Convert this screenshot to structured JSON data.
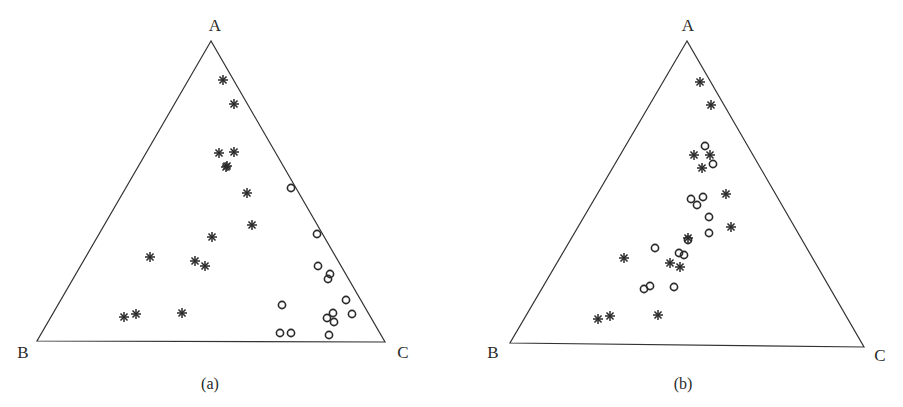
{
  "chart_data": [
    {
      "type": "scatter",
      "subtype": "ternary",
      "caption": "(a)",
      "vertex_labels": {
        "top": "A",
        "left": "B",
        "right": "C"
      },
      "frame": {
        "apex": [
          211,
          41
        ],
        "left": [
          37,
          341
        ],
        "right": [
          385,
          342
        ]
      },
      "label_pos": {
        "A": [
          215,
          25
        ],
        "B": [
          23,
          352
        ],
        "C": [
          403,
          352
        ],
        "caption": [
          210,
          383
        ]
      },
      "series": [
        {
          "name": "asterisk",
          "marker": "asterisk",
          "pixels": [
            [
              223,
              80
            ],
            [
              234,
              104
            ],
            [
              219,
              153
            ],
            [
              234,
              152
            ],
            [
              227,
              166
            ],
            [
              226,
              167
            ],
            [
              247,
              193
            ],
            [
              252,
              225
            ],
            [
              212,
              237
            ],
            [
              150,
              257
            ],
            [
              195,
              261
            ],
            [
              205,
              266
            ],
            [
              124,
              317
            ],
            [
              136,
              314
            ],
            [
              182,
              313
            ]
          ],
          "ternary_ABC": [
            [
              0.87,
              0.09,
              0.04
            ],
            [
              0.79,
              0.14,
              0.07
            ],
            [
              0.63,
              0.29,
              0.08
            ],
            [
              0.63,
              0.25,
              0.12
            ],
            [
              0.59,
              0.3,
              0.11
            ],
            [
              0.58,
              0.31,
              0.11
            ],
            [
              0.5,
              0.32,
              0.18
            ],
            [
              0.39,
              0.39,
              0.22
            ],
            [
              0.35,
              0.49,
              0.16
            ],
            [
              0.28,
              0.7,
              0.02
            ],
            [
              0.27,
              0.58,
              0.15
            ],
            [
              0.25,
              0.55,
              0.2
            ],
            [
              0.08,
              0.84,
              0.08
            ],
            [
              0.09,
              0.8,
              0.11
            ],
            [
              0.1,
              0.66,
              0.24
            ]
          ]
        },
        {
          "name": "circle",
          "marker": "circle",
          "pixels": [
            [
              291,
              188
            ],
            [
              317,
              234
            ],
            [
              318,
              266
            ],
            [
              330,
              274
            ],
            [
              328,
              279
            ],
            [
              346,
              300
            ],
            [
              282,
              305
            ],
            [
              333,
              313
            ],
            [
              352,
              314
            ],
            [
              327,
              318
            ],
            [
              334,
              322
            ],
            [
              280,
              333
            ],
            [
              291,
              333
            ],
            [
              329,
              335
            ]
          ],
          "ternary_ABC": [
            [
              0.51,
              0.05,
              0.44
            ],
            [
              0.36,
              0.05,
              0.59
            ],
            [
              0.25,
              0.1,
              0.65
            ],
            [
              0.23,
              0.06,
              0.71
            ],
            [
              0.21,
              0.08,
              0.71
            ],
            [
              0.14,
              0.04,
              0.82
            ],
            [
              0.12,
              0.26,
              0.62
            ],
            [
              0.1,
              0.08,
              0.82
            ],
            [
              0.09,
              0.03,
              0.88
            ],
            [
              0.08,
              0.11,
              0.81
            ],
            [
              0.07,
              0.09,
              0.84
            ],
            [
              0.03,
              0.32,
              0.65
            ],
            [
              0.03,
              0.29,
              0.68
            ],
            [
              0.02,
              0.15,
              0.83
            ]
          ]
        }
      ]
    },
    {
      "type": "scatter",
      "subtype": "ternary",
      "caption": "(b)",
      "vertex_labels": {
        "top": "A",
        "left": "B",
        "right": "C"
      },
      "frame": {
        "apex": [
          687,
          41
        ],
        "left": [
          510,
          343
        ],
        "right": [
          864,
          347
        ]
      },
      "label_pos": {
        "A": [
          688,
          25
        ],
        "B": [
          493,
          352
        ],
        "C": [
          880,
          355
        ],
        "caption": [
          683,
          383
        ]
      },
      "series": [
        {
          "name": "asterisk",
          "marker": "asterisk",
          "pixels": [
            [
              700,
              82
            ],
            [
              711,
              105
            ],
            [
              694,
              155
            ],
            [
              710,
              155
            ],
            [
              702,
              168
            ],
            [
              726,
              194
            ],
            [
              731,
              227
            ],
            [
              688,
              238
            ],
            [
              670,
              263
            ],
            [
              680,
              267
            ],
            [
              624,
              258
            ],
            [
              598,
              319
            ],
            [
              610,
              316
            ],
            [
              658,
              315
            ]
          ],
          "ternary_ABC": [
            [
              0.86,
              0.09,
              0.05
            ],
            [
              0.79,
              0.13,
              0.08
            ],
            [
              0.62,
              0.34,
              0.04
            ],
            [
              0.62,
              0.29,
              0.09
            ],
            [
              0.58,
              0.3,
              0.12
            ],
            [
              0.5,
              0.32,
              0.18
            ],
            [
              0.38,
              0.39,
              0.23
            ],
            [
              0.35,
              0.5,
              0.15
            ],
            [
              0.26,
              0.62,
              0.12
            ],
            [
              0.25,
              0.59,
              0.16
            ],
            [
              0.28,
              0.7,
              0.02
            ],
            [
              0.08,
              0.84,
              0.08
            ],
            [
              0.09,
              0.8,
              0.11
            ],
            [
              0.09,
              0.67,
              0.24
            ]
          ]
        },
        {
          "name": "circle",
          "marker": "circle",
          "pixels": [
            [
              705,
              146
            ],
            [
              713,
              164
            ],
            [
              691,
              199
            ],
            [
              703,
              197
            ],
            [
              697,
              205
            ],
            [
              709,
              217
            ],
            [
              709,
              233
            ],
            [
              688,
              240
            ],
            [
              655,
              248
            ],
            [
              679,
              253
            ],
            [
              684,
              255
            ],
            [
              644,
              289
            ],
            [
              650,
              286
            ],
            [
              674,
              287
            ]
          ],
          "ternary_ABC": [
            [
              0.65,
              0.29,
              0.06
            ],
            [
              0.59,
              0.28,
              0.13
            ],
            [
              0.48,
              0.43,
              0.09
            ],
            [
              0.48,
              0.4,
              0.12
            ],
            [
              0.46,
              0.43,
              0.11
            ],
            [
              0.42,
              0.42,
              0.16
            ],
            [
              0.37,
              0.45,
              0.18
            ],
            [
              0.34,
              0.52,
              0.14
            ],
            [
              0.32,
              0.63,
              0.05
            ],
            [
              0.3,
              0.57,
              0.13
            ],
            [
              0.29,
              0.55,
              0.16
            ],
            [
              0.18,
              0.72,
              0.1
            ],
            [
              0.19,
              0.7,
              0.11
            ],
            [
              0.18,
              0.64,
              0.18
            ]
          ]
        }
      ]
    }
  ]
}
